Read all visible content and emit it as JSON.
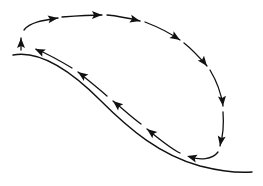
{
  "diagram": {
    "type": "circulation-flow",
    "colors": {
      "stroke": "#111111",
      "background": "#ffffff"
    },
    "surface": {
      "path": "M13,55 C40,50 70,70 100,100 C130,130 160,155 200,166 C220,171 240,173 252,172"
    },
    "loop": {
      "segments": [
        "M21,50 L21,38",
        "M24,30 C30,22 45,20 58,18",
        "M62,17 C75,16 88,15 102,15",
        "M107,15 C118,16 128,18 140,21",
        "M145,22 C158,27 170,33 180,40",
        "M184,43 C193,50 200,58 207,66",
        "M210,70 C216,80 221,92 223,106",
        "M223,112 C224,125 223,136 220,146",
        "M218,152 C212,160 200,160 190,157",
        "M180,153 C170,148 158,138 147,129",
        "M141,124 C130,116 122,108 113,101",
        "M107,96 C98,88 88,80 78,72",
        "M72,68 C62,62 50,55 36,49"
      ],
      "arrows": [
        {
          "x": 21,
          "y": 38,
          "angle": -90
        },
        {
          "x": 58,
          "y": 18,
          "angle": -8
        },
        {
          "x": 102,
          "y": 15,
          "angle": 0
        },
        {
          "x": 140,
          "y": 21,
          "angle": 14
        },
        {
          "x": 180,
          "y": 40,
          "angle": 32
        },
        {
          "x": 207,
          "y": 66,
          "angle": 52
        },
        {
          "x": 223,
          "y": 106,
          "angle": 84
        },
        {
          "x": 220,
          "y": 146,
          "angle": 100
        },
        {
          "x": 187,
          "y": 156,
          "angle": 195
        },
        {
          "x": 147,
          "y": 129,
          "angle": 218
        },
        {
          "x": 113,
          "y": 101,
          "angle": 220
        },
        {
          "x": 78,
          "y": 72,
          "angle": 215
        },
        {
          "x": 35,
          "y": 49,
          "angle": 205
        }
      ]
    }
  }
}
